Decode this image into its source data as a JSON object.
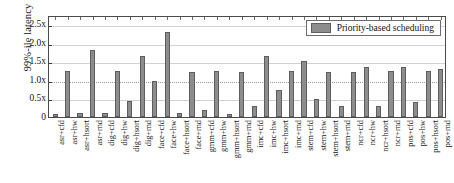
{
  "chart_data": {
    "type": "bar",
    "title": "",
    "subtitle": "",
    "xlabel": "",
    "ylabel": "99%-ile latency",
    "ylim": [
      0,
      2.75
    ],
    "yticks": [
      0,
      0.5,
      1.0,
      1.5,
      2.0,
      2.5
    ],
    "ytick_labels": [
      "0",
      "0.5x",
      "1.0x",
      "1.5x",
      "2.0x",
      "2.5x"
    ],
    "grid": true,
    "reference_line": 1.0,
    "legend_position": "top-right",
    "legend": [
      "Priority-based scheduling"
    ],
    "bar_color": "#8d8d8d",
    "bar_edge_color": "#5e5e5e",
    "categories": [
      "asr+cfd",
      "asr+hw",
      "asr+hsort",
      "asr+rnd",
      "dig+cfd",
      "dig+hw",
      "dig+hsort",
      "dig+rnd",
      "face+cfd",
      "face+hw",
      "face+hsort",
      "face+rnd",
      "gmm+cfd",
      "gmm+hw",
      "gmm+hsort",
      "gmm+rnd",
      "imc+cfd",
      "imc+hw",
      "imc+hsort",
      "imc+rnd",
      "stem+cfd",
      "stem+hw",
      "stem+hsort",
      "stem+rnd",
      "ncr+cfd",
      "ncr+hw",
      "ncr+hsort",
      "ncr+rnd",
      "pos+cfd",
      "pos+hw",
      "pos+hsort",
      "pos+rnd"
    ],
    "series": [
      {
        "name": "Priority-based scheduling",
        "values": [
          0.09,
          1.25,
          0.1,
          1.8,
          0.1,
          1.25,
          0.42,
          1.65,
          0.97,
          2.3,
          0.12,
          1.22,
          0.2,
          1.25,
          0.08,
          1.22,
          0.3,
          1.65,
          0.72,
          1.25,
          1.5,
          0.48,
          1.22,
          0.3,
          1.22,
          1.35,
          0.3,
          1.25,
          1.35,
          0.4,
          1.25,
          1.3
        ]
      }
    ]
  },
  "legend": {
    "label": "Priority-based scheduling"
  },
  "axes": {
    "y_title": "99%-ile latency"
  }
}
